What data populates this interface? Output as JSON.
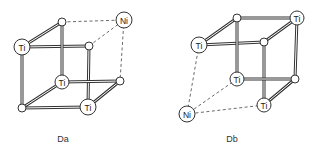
{
  "diagrams": [
    {
      "id": "Da",
      "caption": "Da",
      "caption_pos": [
        63,
        142
      ],
      "nodes": [
        {
          "key": "tbl",
          "x": 62,
          "y": 22,
          "r": 4,
          "label": ""
        },
        {
          "key": "tbr",
          "x": 124,
          "y": 20,
          "r": 8,
          "label": "Ni"
        },
        {
          "key": "tfl",
          "x": 22,
          "y": 47,
          "r": 8,
          "label": "Ti"
        },
        {
          "key": "tfr",
          "x": 89,
          "y": 46,
          "r": 4,
          "label": ""
        },
        {
          "key": "bbl",
          "x": 62,
          "y": 82,
          "r": 7,
          "label": "Ti"
        },
        {
          "key": "bbr",
          "x": 120,
          "y": 81,
          "r": 4,
          "label": ""
        },
        {
          "key": "bfl",
          "x": 22,
          "y": 108,
          "r": 4,
          "label": ""
        },
        {
          "key": "bfr",
          "x": 88,
          "y": 107,
          "r": 8,
          "label": "Ti"
        }
      ],
      "rods": [
        [
          "tfl",
          "tbl"
        ],
        [
          "tfl",
          "tfr"
        ],
        [
          "tfl",
          "bfl"
        ],
        [
          "tbl",
          "bbl"
        ],
        [
          "tfr",
          "bfr"
        ],
        [
          "bfl",
          "bbl"
        ],
        [
          "bfl",
          "bfr"
        ],
        [
          "bbl",
          "bbr"
        ],
        [
          "bfr",
          "bbr"
        ]
      ],
      "dashed": [
        [
          "tbl",
          "tbr"
        ],
        [
          "tfr",
          "tbr"
        ],
        [
          "tbr",
          "bbr"
        ]
      ]
    },
    {
      "id": "Db",
      "caption": "Db",
      "caption_pos": [
        232,
        142
      ],
      "nodes": [
        {
          "key": "tbl",
          "x": 237,
          "y": 18,
          "r": 4,
          "label": ""
        },
        {
          "key": "tbr",
          "x": 297,
          "y": 18,
          "r": 7,
          "label": "Ti"
        },
        {
          "key": "tfl",
          "x": 199,
          "y": 45,
          "r": 8,
          "label": "Ti"
        },
        {
          "key": "tfr",
          "x": 264,
          "y": 42,
          "r": 4,
          "label": ""
        },
        {
          "key": "bbl",
          "x": 237,
          "y": 79,
          "r": 7,
          "label": "Ti"
        },
        {
          "key": "bbr",
          "x": 295,
          "y": 79,
          "r": 4,
          "label": ""
        },
        {
          "key": "ni",
          "x": 187,
          "y": 114,
          "r": 8,
          "label": "Ni"
        },
        {
          "key": "bfr",
          "x": 264,
          "y": 105,
          "r": 7,
          "label": "Ti"
        }
      ],
      "rods": [
        [
          "tfl",
          "tbl"
        ],
        [
          "tbl",
          "tbr"
        ],
        [
          "tfl",
          "tfr"
        ],
        [
          "tfr",
          "tbr"
        ],
        [
          "tbl",
          "bbl"
        ],
        [
          "tfr",
          "bfr"
        ],
        [
          "tbr",
          "bbr"
        ],
        [
          "bbl",
          "bbr"
        ],
        [
          "bfr",
          "bbr"
        ]
      ],
      "dashed": [
        [
          "tfl",
          "ni"
        ],
        [
          "bbl",
          "ni"
        ],
        [
          "bfr",
          "ni"
        ]
      ]
    }
  ]
}
